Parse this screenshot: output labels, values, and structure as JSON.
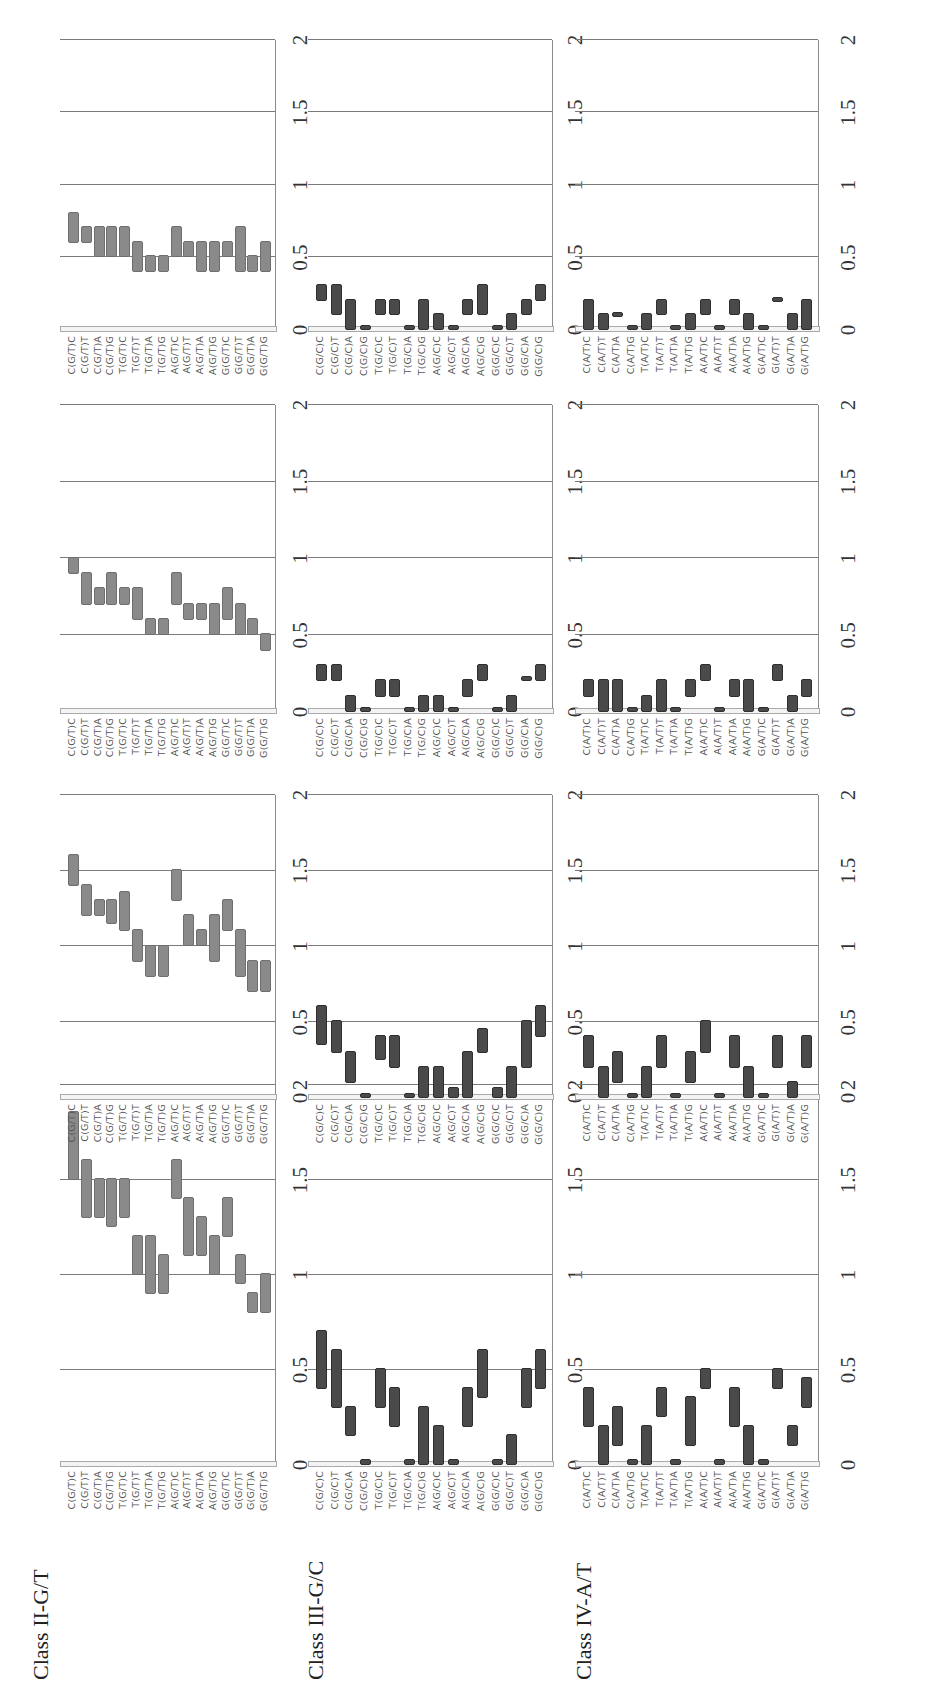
{
  "figure": {
    "orientation": "rotated-90-ccw",
    "bar_color_class_ii": "#8a8a8a",
    "bar_color_other": "#4a4a4a",
    "axis_ticks": [
      "0",
      "0.5",
      "1",
      "1.5",
      "2"
    ]
  },
  "chart_data": [
    {
      "type": "bar",
      "subtype": "floating-range",
      "title": "Class II-G/T",
      "panels": 4,
      "ylim": [
        0,
        2
      ],
      "yticks": [
        0,
        0.5,
        1,
        1.5,
        2
      ],
      "categories": [
        "C(G/T)C",
        "C(G/T)T",
        "C(G/T)A",
        "C(G/T)G",
        "T(G/T)C",
        "T(G/T)T",
        "T(G/T)A",
        "T(G/T)G",
        "A(G/T)C",
        "A(G/T)T",
        "A(G/T)A",
        "A(G/T)G",
        "G(G/T)C",
        "G(G/T)T",
        "G(G/T)A",
        "G(G/T)G"
      ],
      "series": [
        {
          "name": "panel-1",
          "ranges": [
            [
              1.5,
              1.85
            ],
            [
              1.3,
              1.6
            ],
            [
              1.3,
              1.5
            ],
            [
              1.25,
              1.5
            ],
            [
              1.3,
              1.5
            ],
            [
              1.0,
              1.2
            ],
            [
              0.9,
              1.2
            ],
            [
              0.9,
              1.1
            ],
            [
              1.4,
              1.6
            ],
            [
              1.1,
              1.4
            ],
            [
              1.1,
              1.3
            ],
            [
              1.0,
              1.2
            ],
            [
              1.2,
              1.4
            ],
            [
              0.95,
              1.1
            ],
            [
              0.8,
              0.9
            ],
            [
              0.8,
              1.0
            ]
          ]
        },
        {
          "name": "panel-2",
          "ranges": [
            [
              1.4,
              1.6
            ],
            [
              1.2,
              1.4
            ],
            [
              1.2,
              1.3
            ],
            [
              1.15,
              1.3
            ],
            [
              1.1,
              1.35
            ],
            [
              0.9,
              1.1
            ],
            [
              0.8,
              1.0
            ],
            [
              0.8,
              1.0
            ],
            [
              1.3,
              1.5
            ],
            [
              1.0,
              1.2
            ],
            [
              1.0,
              1.1
            ],
            [
              0.9,
              1.2
            ],
            [
              1.1,
              1.3
            ],
            [
              0.8,
              1.1
            ],
            [
              0.7,
              0.9
            ],
            [
              0.7,
              0.9
            ]
          ]
        },
        {
          "name": "panel-3",
          "ranges": [
            [
              0.9,
              1.0
            ],
            [
              0.7,
              0.9
            ],
            [
              0.7,
              0.8
            ],
            [
              0.7,
              0.9
            ],
            [
              0.7,
              0.8
            ],
            [
              0.6,
              0.8
            ],
            [
              0.5,
              0.6
            ],
            [
              0.5,
              0.6
            ],
            [
              0.7,
              0.9
            ],
            [
              0.6,
              0.7
            ],
            [
              0.6,
              0.7
            ],
            [
              0.5,
              0.7
            ],
            [
              0.6,
              0.8
            ],
            [
              0.5,
              0.7
            ],
            [
              0.5,
              0.6
            ],
            [
              0.4,
              0.5
            ]
          ]
        },
        {
          "name": "panel-4",
          "ranges": [
            [
              0.6,
              0.8
            ],
            [
              0.6,
              0.7
            ],
            [
              0.5,
              0.7
            ],
            [
              0.5,
              0.7
            ],
            [
              0.5,
              0.7
            ],
            [
              0.4,
              0.6
            ],
            [
              0.4,
              0.5
            ],
            [
              0.4,
              0.5
            ],
            [
              0.5,
              0.7
            ],
            [
              0.5,
              0.6
            ],
            [
              0.4,
              0.6
            ],
            [
              0.4,
              0.6
            ],
            [
              0.5,
              0.6
            ],
            [
              0.4,
              0.7
            ],
            [
              0.4,
              0.5
            ],
            [
              0.4,
              0.6
            ]
          ]
        }
      ]
    },
    {
      "type": "bar",
      "subtype": "floating-range",
      "title": "Class III-G/C",
      "panels": 4,
      "ylim": [
        0,
        2
      ],
      "yticks": [
        0,
        0.5,
        1,
        1.5,
        2
      ],
      "categories": [
        "C(G/C)C",
        "C(G/C)T",
        "C(G/C)A",
        "C(G/C)G",
        "T(G/C)C",
        "T(G/C)T",
        "T(G/C)A",
        "T(G/C)G",
        "A(G/C)C",
        "A(G/C)T",
        "A(G/C)A",
        "A(G/C)G",
        "G(G/C)C",
        "G(G/C)T",
        "G(G/C)A",
        "G(G/C)G"
      ],
      "series": [
        {
          "name": "panel-1",
          "ranges": [
            [
              0.4,
              0.7
            ],
            [
              0.3,
              0.6
            ],
            [
              0.15,
              0.3
            ],
            [
              0.0,
              0.02
            ],
            [
              0.3,
              0.5
            ],
            [
              0.2,
              0.4
            ],
            [
              0.0,
              0.02
            ],
            [
              0.0,
              0.3
            ],
            [
              0.0,
              0.2
            ],
            [
              0.0,
              0.02
            ],
            [
              0.2,
              0.4
            ],
            [
              0.35,
              0.6
            ],
            [
              0.0,
              0.02
            ],
            [
              0.0,
              0.15
            ],
            [
              0.3,
              0.5
            ],
            [
              0.4,
              0.6
            ]
          ]
        },
        {
          "name": "panel-2",
          "ranges": [
            [
              0.35,
              0.6
            ],
            [
              0.3,
              0.5
            ],
            [
              0.1,
              0.3
            ],
            [
              0.0,
              0.02
            ],
            [
              0.25,
              0.4
            ],
            [
              0.2,
              0.4
            ],
            [
              0.0,
              0.02
            ],
            [
              0.0,
              0.2
            ],
            [
              0.0,
              0.2
            ],
            [
              0.0,
              0.06
            ],
            [
              0.0,
              0.3
            ],
            [
              0.3,
              0.45
            ],
            [
              0.0,
              0.06
            ],
            [
              0.0,
              0.2
            ],
            [
              0.2,
              0.5
            ],
            [
              0.4,
              0.6
            ]
          ]
        },
        {
          "name": "panel-3",
          "ranges": [
            [
              0.2,
              0.3
            ],
            [
              0.2,
              0.3
            ],
            [
              0.0,
              0.1
            ],
            [
              0.0,
              0.01
            ],
            [
              0.1,
              0.2
            ],
            [
              0.1,
              0.2
            ],
            [
              0.0,
              0.01
            ],
            [
              0.0,
              0.1
            ],
            [
              0.0,
              0.1
            ],
            [
              0.0,
              0.01
            ],
            [
              0.1,
              0.2
            ],
            [
              0.2,
              0.3
            ],
            [
              0.0,
              0.01
            ],
            [
              0.0,
              0.1
            ],
            [
              0.2,
              0.21
            ],
            [
              0.2,
              0.3
            ]
          ]
        },
        {
          "name": "panel-4",
          "ranges": [
            [
              0.2,
              0.3
            ],
            [
              0.1,
              0.3
            ],
            [
              0.0,
              0.2
            ],
            [
              0.0,
              0.02
            ],
            [
              0.1,
              0.2
            ],
            [
              0.1,
              0.2
            ],
            [
              0.0,
              0.02
            ],
            [
              0.0,
              0.2
            ],
            [
              0.0,
              0.1
            ],
            [
              0.0,
              0.02
            ],
            [
              0.1,
              0.2
            ],
            [
              0.1,
              0.3
            ],
            [
              0.0,
              0.02
            ],
            [
              0.0,
              0.1
            ],
            [
              0.1,
              0.2
            ],
            [
              0.2,
              0.3
            ]
          ]
        }
      ]
    },
    {
      "type": "bar",
      "subtype": "floating-range",
      "title": "Class IV-A/T",
      "panels": 4,
      "ylim": [
        0,
        2
      ],
      "yticks": [
        0,
        0.5,
        1,
        1.5,
        2
      ],
      "categories": [
        "C(A/T)C",
        "C(A/T)T",
        "C(A/T)A",
        "C(A/T)G",
        "T(A/T)C",
        "T(A/T)T",
        "T(A/T)A",
        "T(A/T)G",
        "A(A/T)C",
        "A(A/T)T",
        "A(A/T)A",
        "A(A/T)G",
        "G(A/T)C",
        "G(A/T)T",
        "G(A/T)A",
        "G(A/T)G"
      ],
      "series": [
        {
          "name": "panel-1",
          "ranges": [
            [
              0.2,
              0.4
            ],
            [
              0.0,
              0.2
            ],
            [
              0.1,
              0.3
            ],
            [
              0.0,
              0.02
            ],
            [
              0.0,
              0.2
            ],
            [
              0.25,
              0.4
            ],
            [
              0.0,
              0.02
            ],
            [
              0.1,
              0.35
            ],
            [
              0.4,
              0.5
            ],
            [
              0.0,
              0.02
            ],
            [
              0.2,
              0.4
            ],
            [
              0.0,
              0.2
            ],
            [
              0.0,
              0.02
            ],
            [
              0.4,
              0.5
            ],
            [
              0.1,
              0.2
            ],
            [
              0.3,
              0.45
            ]
          ]
        },
        {
          "name": "panel-2",
          "ranges": [
            [
              0.2,
              0.4
            ],
            [
              0.0,
              0.2
            ],
            [
              0.1,
              0.3
            ],
            [
              0.0,
              0.02
            ],
            [
              0.0,
              0.2
            ],
            [
              0.2,
              0.4
            ],
            [
              0.0,
              0.02
            ],
            [
              0.1,
              0.3
            ],
            [
              0.3,
              0.5
            ],
            [
              0.0,
              0.02
            ],
            [
              0.2,
              0.4
            ],
            [
              0.0,
              0.2
            ],
            [
              0.0,
              0.02
            ],
            [
              0.2,
              0.4
            ],
            [
              0.0,
              0.1
            ],
            [
              0.2,
              0.4
            ]
          ]
        },
        {
          "name": "panel-3",
          "ranges": [
            [
              0.1,
              0.2
            ],
            [
              0.0,
              0.2
            ],
            [
              0.0,
              0.2
            ],
            [
              0.0,
              0.01
            ],
            [
              0.0,
              0.1
            ],
            [
              0.0,
              0.2
            ],
            [
              0.0,
              0.01
            ],
            [
              0.1,
              0.2
            ],
            [
              0.2,
              0.3
            ],
            [
              0.0,
              0.01
            ],
            [
              0.1,
              0.2
            ],
            [
              0.0,
              0.2
            ],
            [
              0.0,
              0.01
            ],
            [
              0.2,
              0.3
            ],
            [
              0.0,
              0.1
            ],
            [
              0.1,
              0.2
            ]
          ]
        },
        {
          "name": "panel-4",
          "ranges": [
            [
              0.0,
              0.2
            ],
            [
              0.0,
              0.1
            ],
            [
              0.09,
              0.1
            ],
            [
              0.0,
              0.01
            ],
            [
              0.0,
              0.1
            ],
            [
              0.1,
              0.2
            ],
            [
              0.0,
              0.01
            ],
            [
              0.0,
              0.1
            ],
            [
              0.1,
              0.2
            ],
            [
              0.0,
              0.01
            ],
            [
              0.1,
              0.2
            ],
            [
              0.0,
              0.1
            ],
            [
              0.0,
              0.01
            ],
            [
              0.19,
              0.2
            ],
            [
              0.0,
              0.1
            ],
            [
              0.0,
              0.2
            ]
          ]
        }
      ]
    }
  ]
}
